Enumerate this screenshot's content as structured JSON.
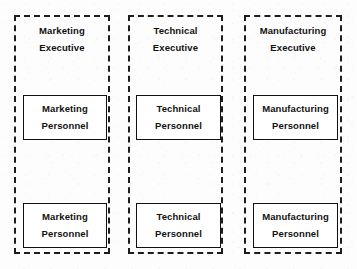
{
  "diagram": {
    "background_color": "#fdfdfd",
    "line_color": "#1d1d1d",
    "text_color": "#121212",
    "columns": [
      {
        "id": "marketing",
        "header": {
          "line1": "Marketing",
          "line2": "Executive"
        },
        "boxes": [
          {
            "line1": "Marketing",
            "line2": "Personnel"
          },
          {
            "line1": "Marketing",
            "line2": "Personnel"
          }
        ]
      },
      {
        "id": "technical",
        "header": {
          "line1": "Technical",
          "line2": "Executive"
        },
        "boxes": [
          {
            "line1": "Technical",
            "line2": "Personnel"
          },
          {
            "line1": "Technical",
            "line2": "Personnel"
          }
        ]
      },
      {
        "id": "manufacturing",
        "header": {
          "line1": "Manufacturing",
          "line2": "Executive"
        },
        "boxes": [
          {
            "line1": "Manufacturing",
            "line2": "Personnel"
          },
          {
            "line1": "Manufacturing",
            "line2": "Personnel"
          }
        ]
      }
    ]
  }
}
